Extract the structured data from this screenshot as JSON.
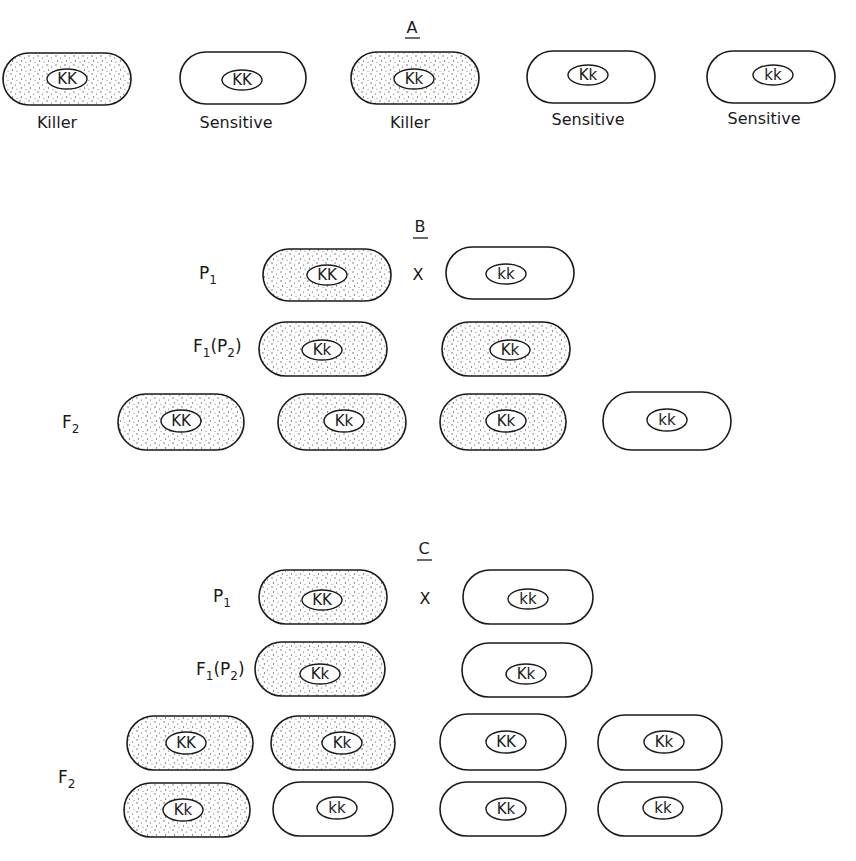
{
  "figure": {
    "colors": {
      "ink": "#1a1a1a",
      "background": "#ffffff",
      "stipple": "#555555"
    },
    "sections": {
      "A": {
        "label": "A",
        "cells": [
          {
            "genotype": "KK",
            "phenotype": "Killer",
            "stippled": true
          },
          {
            "genotype": "KK",
            "phenotype": "Sensitive",
            "stippled": false
          },
          {
            "genotype": "Kk",
            "phenotype": "Killer",
            "stippled": true
          },
          {
            "genotype": "Kk",
            "phenotype": "Sensitive",
            "stippled": false
          },
          {
            "genotype": "kk",
            "phenotype": "Sensitive",
            "stippled": false
          }
        ]
      },
      "B": {
        "label": "B",
        "cross_symbol": "X",
        "rows": {
          "P1": {
            "label_main": "P",
            "label_sub": "1",
            "cells": [
              {
                "genotype": "KK",
                "stippled": true
              },
              {
                "genotype": "kk",
                "stippled": false
              }
            ]
          },
          "F1": {
            "label_main": "F",
            "label_sub": "1",
            "label_paren": "(P",
            "label_paren_sub": "2",
            "label_close": ")",
            "cells": [
              {
                "genotype": "Kk",
                "stippled": true
              },
              {
                "genotype": "Kk",
                "stippled": true
              }
            ]
          },
          "F2": {
            "label_main": "F",
            "label_sub": "2",
            "cells": [
              {
                "genotype": "KK",
                "stippled": true
              },
              {
                "genotype": "Kk",
                "stippled": true
              },
              {
                "genotype": "Kk",
                "stippled": true
              },
              {
                "genotype": "kk",
                "stippled": false
              }
            ]
          }
        }
      },
      "C": {
        "label": "C",
        "cross_symbol": "X",
        "rows": {
          "P1": {
            "label_main": "P",
            "label_sub": "1",
            "cells": [
              {
                "genotype": "KK",
                "stippled": true
              },
              {
                "genotype": "kk",
                "stippled": false
              }
            ]
          },
          "F1": {
            "label_main": "F",
            "label_sub": "1",
            "label_paren": "(P",
            "label_paren_sub": "2",
            "label_close": ")",
            "cells": [
              {
                "genotype": "Kk",
                "stippled": true
              },
              {
                "genotype": "Kk",
                "stippled": false
              }
            ]
          },
          "F2": {
            "label_main": "F",
            "label_sub": "2",
            "cells": [
              {
                "genotype": "KK",
                "stippled": true
              },
              {
                "genotype": "Kk",
                "stippled": true
              },
              {
                "genotype": "KK",
                "stippled": false
              },
              {
                "genotype": "Kk",
                "stippled": false
              },
              {
                "genotype": "Kk",
                "stippled": true
              },
              {
                "genotype": "kk",
                "stippled": false
              },
              {
                "genotype": "Kk",
                "stippled": false
              },
              {
                "genotype": "kk",
                "stippled": false
              }
            ]
          }
        }
      }
    }
  }
}
